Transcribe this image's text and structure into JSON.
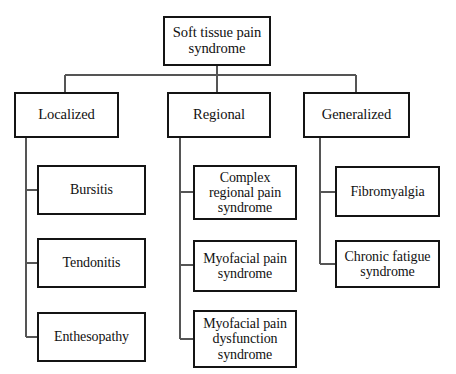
{
  "diagram": {
    "type": "hierarchy-tree",
    "background_color": "#ffffff",
    "border_color": "#141414",
    "connector_color": "#555555",
    "root": {
      "label": "Soft tissue pain syndrome"
    },
    "branches": [
      {
        "label": "Localized",
        "children": [
          {
            "label": "Bursitis"
          },
          {
            "label": "Tendonitis"
          },
          {
            "label": "Enthesopathy"
          }
        ]
      },
      {
        "label": "Regional",
        "children": [
          {
            "label": "Complex regional pain syndrome"
          },
          {
            "label": "Myofacial pain syndrome"
          },
          {
            "label": "Myofacial pain dysfunction syndrome"
          }
        ]
      },
      {
        "label": "Generalized",
        "children": [
          {
            "label": "Fibromyalgia"
          },
          {
            "label": "Chronic fatigue syndrome"
          }
        ]
      }
    ]
  }
}
